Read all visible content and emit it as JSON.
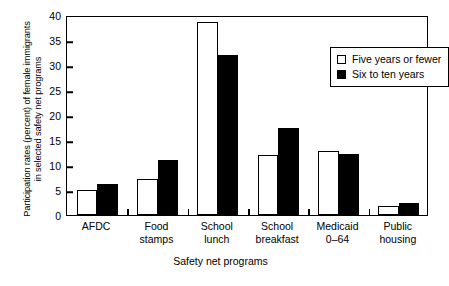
{
  "chart_data": {
    "type": "bar",
    "title": "",
    "xlabel": "Safety net programs",
    "ylabel": "Participation rates (percent) of female immigrants in selected safety net programs",
    "ylabel_line1": "Participation rates (percent) of female immigrants",
    "ylabel_line2": "in selected safety net programs",
    "categories": [
      "AFDC",
      "Food\nstamps",
      "School\nlunch",
      "School\nbreakfast",
      "Medicaid\n0–64",
      "Public\nhousing"
    ],
    "series": [
      {
        "name": "Five years or fewer",
        "color": "#ffffff",
        "values": [
          5.0,
          7.3,
          38.7,
          12.0,
          12.9,
          1.9
        ]
      },
      {
        "name": "Six to ten years",
        "color": "#000000",
        "values": [
          6.3,
          11.0,
          32.0,
          17.5,
          12.3,
          2.4
        ]
      }
    ],
    "ylim": [
      0,
      40
    ],
    "yticks": [
      0,
      5,
      10,
      15,
      20,
      25,
      30,
      35,
      40
    ],
    "ytick_labels": [
      "0",
      "5",
      "10",
      "15",
      "20",
      "25",
      "30",
      "35",
      "40"
    ],
    "grid": false,
    "legend_position": "top-right"
  },
  "legend": {
    "items": [
      {
        "label": "Five years or fewer",
        "swatch": "open-square-icon"
      },
      {
        "label": "Six to ten years",
        "swatch": "filled-square-icon"
      }
    ]
  }
}
